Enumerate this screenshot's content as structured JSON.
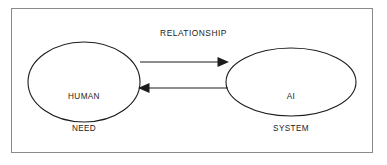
{
  "diagram": {
    "title": "RELATIONSHIP",
    "frame": {
      "name": "outer-border",
      "color": "#8a8a8a"
    },
    "stroke_color": "#1c1c1c",
    "fill_color": "#ffffff",
    "background": "#ffffff",
    "nodes": [
      {
        "id": "human-need",
        "label_line1": "HUMAN",
        "label_line2": "NEED",
        "shape": "ellipse"
      },
      {
        "id": "ai-system",
        "label_line1": "AI",
        "label_line2": "SYSTEM",
        "shape": "ellipse"
      }
    ],
    "connectors": [
      {
        "id": "human-to-ai",
        "from": "human-need",
        "to": "ai-system",
        "direction": "right",
        "style": "solid-arrow"
      },
      {
        "id": "ai-to-human",
        "from": "ai-system",
        "to": "human-need",
        "direction": "left",
        "style": "solid-arrow"
      }
    ]
  }
}
